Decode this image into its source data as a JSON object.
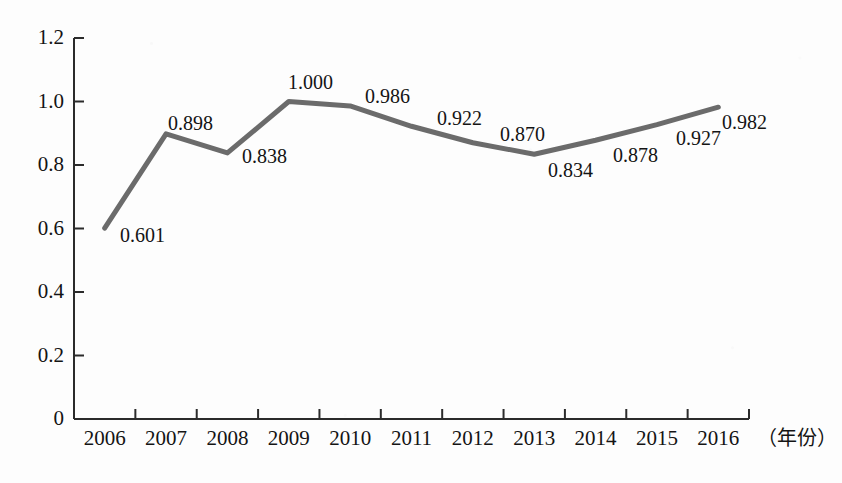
{
  "figure": {
    "background_color": "#fdfdfd",
    "line_color": "#6b6b6b",
    "axis_color": "#2b2b2b",
    "text_color": "#141414"
  },
  "axis": {
    "x_caption": "（年份）",
    "y_ticks": [
      "1.2",
      "1.0",
      "0.8",
      "0.6",
      "0.4",
      "0.2",
      "0"
    ],
    "x_ticks": [
      "2006",
      "2007",
      "2008",
      "2009",
      "2010",
      "2011",
      "2012",
      "2013",
      "2014",
      "2015",
      "2016"
    ]
  },
  "chart_data": {
    "type": "line",
    "title": "",
    "xlabel": "（年份）",
    "ylabel": "",
    "categories": [
      "2006",
      "2007",
      "2008",
      "2009",
      "2010",
      "2011",
      "2012",
      "2013",
      "2014",
      "2015",
      "2016"
    ],
    "values": [
      0.601,
      0.898,
      0.838,
      1.0,
      0.986,
      0.922,
      0.87,
      0.834,
      0.878,
      0.927,
      0.982
    ],
    "point_labels": [
      "0.601",
      "0.898",
      "0.838",
      "1.000",
      "0.986",
      "0.922",
      "0.870",
      "0.834",
      "0.878",
      "0.927",
      "0.982"
    ],
    "ylim": [
      0,
      1.2
    ],
    "yticks": [
      0,
      0.2,
      0.4,
      0.6,
      0.8,
      1.0,
      1.2
    ],
    "ytick_labels": [
      "0",
      "0.2",
      "0.4",
      "0.6",
      "0.8",
      "1.0",
      "1.2"
    ],
    "grid": false,
    "legend": null,
    "series": [
      {
        "name": "",
        "values": [
          0.601,
          0.898,
          0.838,
          1.0,
          0.986,
          0.922,
          0.87,
          0.834,
          0.878,
          0.927,
          0.982
        ]
      }
    ]
  },
  "label_offsets": [
    {
      "text": "0.601",
      "x": 120,
      "y": 225
    },
    {
      "text": "0.898",
      "x": 168,
      "y": 113
    },
    {
      "text": "0.838",
      "x": 242,
      "y": 146
    },
    {
      "text": "1.000",
      "x": 288,
      "y": 72
    },
    {
      "text": "0.986",
      "x": 365,
      "y": 86
    },
    {
      "text": "0.922",
      "x": 437,
      "y": 108
    },
    {
      "text": "0.870",
      "x": 500,
      "y": 124
    },
    {
      "text": "0.834",
      "x": 548,
      "y": 160
    },
    {
      "text": "0.878",
      "x": 613,
      "y": 145
    },
    {
      "text": "0.927",
      "x": 676,
      "y": 128
    },
    {
      "text": "0.982",
      "x": 722,
      "y": 112
    }
  ]
}
